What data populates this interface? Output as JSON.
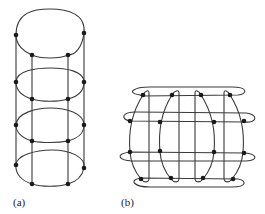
{
  "figures": [
    {
      "id": "a",
      "label": "(a)",
      "description": "Cylinder-like stack of four elliptical rings joined by four vertical rails",
      "rails_x": [
        16,
        32,
        68,
        84
      ],
      "rail_y_range": [
        35,
        184
      ],
      "rings": [
        {
          "cy_top": 10,
          "cy_bottom": 59
        },
        {
          "cy_top": 68,
          "cy_bottom": 102
        },
        {
          "cy_top": 108,
          "cy_bottom": 143
        },
        {
          "cy_top": 150,
          "cy_bottom": 187
        }
      ],
      "node_count": 16
    },
    {
      "id": "b",
      "label": "(b)",
      "description": "Barrel-shaped grid of four horizontal loops crossed by four vertical lens loops",
      "horizontal_loops": 4,
      "vertical_loops": 4,
      "node_count": 16
    }
  ],
  "colors": {
    "stroke": "#3a3a3a",
    "node": "#1a1a1a",
    "background": "#ffffff"
  }
}
